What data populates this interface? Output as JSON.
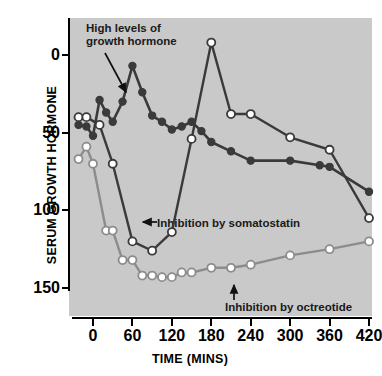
{
  "chart_data": {
    "type": "line",
    "title": "",
    "xlabel": "TIME (MINS)",
    "ylabel": "SERUM GROWTH HORMONE",
    "xlim": [
      -30,
      420
    ],
    "ylim": [
      0,
      172
    ],
    "xticks": [
      0,
      60,
      120,
      180,
      240,
      300,
      360,
      420
    ],
    "yticks": [
      0,
      50,
      100,
      150
    ],
    "grid": false,
    "legend_position": "none",
    "background_color": "#c9c9c9",
    "series": [
      {
        "name": "High levels of growth hormone",
        "marker": "filled-circle",
        "color": "#3a3a3a",
        "marker_fill": "#3a3a3a",
        "x": [
          -22,
          -10,
          0,
          10,
          20,
          30,
          45,
          60,
          75,
          90,
          105,
          120,
          135,
          150,
          165,
          180,
          210,
          240,
          300,
          345,
          360,
          420
        ],
        "y": [
          105,
          104,
          98,
          121,
          113,
          107,
          120,
          143,
          126,
          111,
          107,
          102,
          104,
          107,
          101,
          94,
          88,
          82,
          82,
          79,
          78,
          62
        ]
      },
      {
        "name": "Inhibition by somatostatin",
        "marker": "open-circle",
        "color": "#3a3a3a",
        "marker_fill": "#ffffff",
        "x": [
          -22,
          -10,
          10,
          30,
          60,
          90,
          120,
          150,
          180,
          210,
          240,
          300,
          360,
          420
        ],
        "y": [
          110,
          110,
          105,
          80,
          30,
          24,
          36,
          96,
          158,
          112,
          112,
          97,
          89,
          45
        ]
      },
      {
        "name": "Inhibition by octreotide",
        "marker": "open-circle",
        "color": "#8c8c8c",
        "marker_fill": "#ffffff",
        "x": [
          -22,
          -10,
          0,
          20,
          30,
          45,
          60,
          75,
          90,
          105,
          120,
          135,
          150,
          180,
          210,
          240,
          300,
          360,
          420
        ],
        "y": [
          83,
          91,
          80,
          37,
          37,
          18,
          18,
          8,
          8,
          7,
          7,
          10,
          10,
          13,
          13,
          15,
          21,
          25,
          30
        ]
      }
    ],
    "annotations": [
      {
        "id": "high-growth-hormone",
        "text": "High levels of\ngrowth hormone",
        "arrow": "diagonal-down-right"
      },
      {
        "id": "inhibition-somatostatin",
        "text": "Inhibition by somatostatin",
        "arrow": "left"
      },
      {
        "id": "inhibition-octreotide",
        "text": "Inhibition by octreotide",
        "arrow": "up"
      }
    ]
  },
  "axes": {
    "y_title": "SERUM GROWTH HORMONE",
    "x_title": "TIME (MINS)",
    "y_tick_labels": [
      "150",
      "100",
      "50",
      "0"
    ],
    "x_tick_labels": [
      "0",
      "60",
      "120",
      "180",
      "240",
      "300",
      "360",
      "420"
    ]
  },
  "annotations": {
    "high_growth_hormone": "High levels of\ngrowth hormone",
    "inhibition_somatostatin": "Inhibition by somatostatin",
    "inhibition_octreotide": "Inhibition by octreotide"
  }
}
